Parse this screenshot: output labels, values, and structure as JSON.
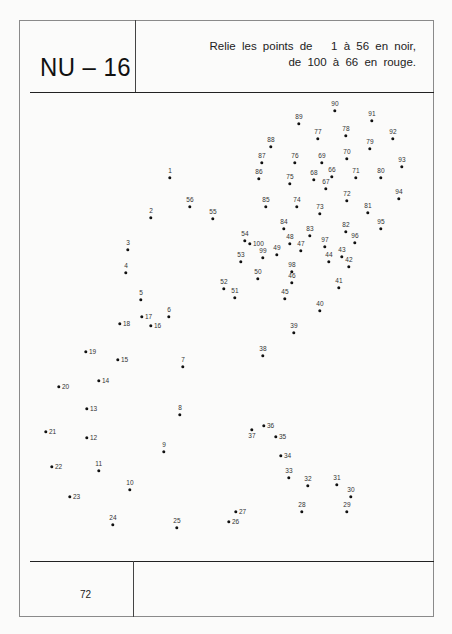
{
  "header": {
    "code": "NU – 16",
    "instruction_line1": "Relie les points de   1 à 56 en noir,",
    "instruction_line2": "de 100 à 66 en rouge."
  },
  "footer": {
    "page_number": "72"
  },
  "colors": {
    "ink": "#111111",
    "frame": "#8a8a8a",
    "paper": "#fbfbfa"
  },
  "puzzle": {
    "black_sequence": "1-56",
    "red_sequence": "100-66",
    "dots": [
      {
        "n": "1",
        "x": 170,
        "y": 178,
        "pos": "above"
      },
      {
        "n": "2",
        "x": 151,
        "y": 218,
        "pos": "above"
      },
      {
        "n": "3",
        "x": 128,
        "y": 250,
        "pos": "above"
      },
      {
        "n": "4",
        "x": 126,
        "y": 273,
        "pos": "above"
      },
      {
        "n": "5",
        "x": 141,
        "y": 300,
        "pos": "above"
      },
      {
        "n": "6",
        "x": 169,
        "y": 317,
        "pos": "above"
      },
      {
        "n": "7",
        "x": 183,
        "y": 367,
        "pos": "above"
      },
      {
        "n": "8",
        "x": 180,
        "y": 415,
        "pos": "above"
      },
      {
        "n": "9",
        "x": 164,
        "y": 452,
        "pos": "above"
      },
      {
        "n": "10",
        "x": 130,
        "y": 490,
        "pos": "above"
      },
      {
        "n": "11",
        "x": 99,
        "y": 471,
        "pos": "above"
      },
      {
        "n": "12",
        "x": 87,
        "y": 438,
        "pos": "right"
      },
      {
        "n": "13",
        "x": 87,
        "y": 409,
        "pos": "right"
      },
      {
        "n": "14",
        "x": 99,
        "y": 381,
        "pos": "right"
      },
      {
        "n": "15",
        "x": 118,
        "y": 360,
        "pos": "right"
      },
      {
        "n": "16",
        "x": 151,
        "y": 326,
        "pos": "right"
      },
      {
        "n": "17",
        "x": 142,
        "y": 317,
        "pos": "right"
      },
      {
        "n": "18",
        "x": 120,
        "y": 324,
        "pos": "right"
      },
      {
        "n": "19",
        "x": 86,
        "y": 352,
        "pos": "right"
      },
      {
        "n": "20",
        "x": 59,
        "y": 387,
        "pos": "right"
      },
      {
        "n": "21",
        "x": 46,
        "y": 432,
        "pos": "right"
      },
      {
        "n": "22",
        "x": 52,
        "y": 467,
        "pos": "right"
      },
      {
        "n": "23",
        "x": 70,
        "y": 497,
        "pos": "right"
      },
      {
        "n": "24",
        "x": 113,
        "y": 525,
        "pos": "above"
      },
      {
        "n": "25",
        "x": 177,
        "y": 528,
        "pos": "above"
      },
      {
        "n": "26",
        "x": 229,
        "y": 522,
        "pos": "right"
      },
      {
        "n": "27",
        "x": 236,
        "y": 512,
        "pos": "right"
      },
      {
        "n": "28",
        "x": 302,
        "y": 512,
        "pos": "above"
      },
      {
        "n": "29",
        "x": 347,
        "y": 512,
        "pos": "above"
      },
      {
        "n": "30",
        "x": 351,
        "y": 497,
        "pos": "above"
      },
      {
        "n": "31",
        "x": 337,
        "y": 485,
        "pos": "above"
      },
      {
        "n": "32",
        "x": 308,
        "y": 486,
        "pos": "above"
      },
      {
        "n": "33",
        "x": 289,
        "y": 478,
        "pos": "above"
      },
      {
        "n": "34",
        "x": 281,
        "y": 456,
        "pos": "right"
      },
      {
        "n": "35",
        "x": 276,
        "y": 437,
        "pos": "right"
      },
      {
        "n": "36",
        "x": 264,
        "y": 426,
        "pos": "right"
      },
      {
        "n": "37",
        "x": 252,
        "y": 430,
        "pos": "below"
      },
      {
        "n": "38",
        "x": 263,
        "y": 356,
        "pos": "above"
      },
      {
        "n": "39",
        "x": 294,
        "y": 333,
        "pos": "above"
      },
      {
        "n": "40",
        "x": 320,
        "y": 311,
        "pos": "above"
      },
      {
        "n": "41",
        "x": 339,
        "y": 288,
        "pos": "above"
      },
      {
        "n": "42",
        "x": 349,
        "y": 267,
        "pos": "above"
      },
      {
        "n": "43",
        "x": 342,
        "y": 257,
        "pos": "above"
      },
      {
        "n": "44",
        "x": 329,
        "y": 262,
        "pos": "above"
      },
      {
        "n": "45",
        "x": 285,
        "y": 299,
        "pos": "above"
      },
      {
        "n": "46",
        "x": 292,
        "y": 283,
        "pos": "above"
      },
      {
        "n": "47",
        "x": 301,
        "y": 251,
        "pos": "above"
      },
      {
        "n": "48",
        "x": 290,
        "y": 244,
        "pos": "above"
      },
      {
        "n": "49",
        "x": 277,
        "y": 255,
        "pos": "above"
      },
      {
        "n": "50",
        "x": 258,
        "y": 279,
        "pos": "above"
      },
      {
        "n": "51",
        "x": 235,
        "y": 298,
        "pos": "above"
      },
      {
        "n": "52",
        "x": 224,
        "y": 289,
        "pos": "above"
      },
      {
        "n": "53",
        "x": 241,
        "y": 262,
        "pos": "above"
      },
      {
        "n": "54",
        "x": 245,
        "y": 241,
        "pos": "above"
      },
      {
        "n": "55",
        "x": 213,
        "y": 219,
        "pos": "above"
      },
      {
        "n": "56",
        "x": 190,
        "y": 207,
        "pos": "above"
      },
      {
        "n": "66",
        "x": 332,
        "y": 177,
        "pos": "above"
      },
      {
        "n": "67",
        "x": 326,
        "y": 189,
        "pos": "above"
      },
      {
        "n": "68",
        "x": 314,
        "y": 180,
        "pos": "above"
      },
      {
        "n": "69",
        "x": 322,
        "y": 163,
        "pos": "above"
      },
      {
        "n": "70",
        "x": 347,
        "y": 159,
        "pos": "above"
      },
      {
        "n": "71",
        "x": 356,
        "y": 178,
        "pos": "above"
      },
      {
        "n": "72",
        "x": 347,
        "y": 201,
        "pos": "above"
      },
      {
        "n": "73",
        "x": 320,
        "y": 214,
        "pos": "above"
      },
      {
        "n": "74",
        "x": 297,
        "y": 207,
        "pos": "above"
      },
      {
        "n": "75",
        "x": 290,
        "y": 184,
        "pos": "above"
      },
      {
        "n": "76",
        "x": 295,
        "y": 163,
        "pos": "above"
      },
      {
        "n": "77",
        "x": 318,
        "y": 139,
        "pos": "above"
      },
      {
        "n": "78",
        "x": 346,
        "y": 136,
        "pos": "above"
      },
      {
        "n": "79",
        "x": 370,
        "y": 149,
        "pos": "above"
      },
      {
        "n": "80",
        "x": 381,
        "y": 178,
        "pos": "above"
      },
      {
        "n": "81",
        "x": 368,
        "y": 213,
        "pos": "above"
      },
      {
        "n": "82",
        "x": 346,
        "y": 232,
        "pos": "above"
      },
      {
        "n": "83",
        "x": 310,
        "y": 236,
        "pos": "above"
      },
      {
        "n": "84",
        "x": 284,
        "y": 229,
        "pos": "above"
      },
      {
        "n": "85",
        "x": 266,
        "y": 207,
        "pos": "above"
      },
      {
        "n": "86",
        "x": 259,
        "y": 179,
        "pos": "above"
      },
      {
        "n": "87",
        "x": 262,
        "y": 163,
        "pos": "above"
      },
      {
        "n": "88",
        "x": 271,
        "y": 147,
        "pos": "above"
      },
      {
        "n": "89",
        "x": 299,
        "y": 124,
        "pos": "above"
      },
      {
        "n": "90",
        "x": 335,
        "y": 111,
        "pos": "above"
      },
      {
        "n": "91",
        "x": 372,
        "y": 121,
        "pos": "above"
      },
      {
        "n": "92",
        "x": 393,
        "y": 139,
        "pos": "above"
      },
      {
        "n": "93",
        "x": 402,
        "y": 167,
        "pos": "above"
      },
      {
        "n": "94",
        "x": 399,
        "y": 199,
        "pos": "above"
      },
      {
        "n": "95",
        "x": 381,
        "y": 229,
        "pos": "above"
      },
      {
        "n": "96",
        "x": 355,
        "y": 243,
        "pos": "above"
      },
      {
        "n": "97",
        "x": 325,
        "y": 247,
        "pos": "above"
      },
      {
        "n": "98",
        "x": 292,
        "y": 272,
        "pos": "above"
      },
      {
        "n": "99",
        "x": 263,
        "y": 258,
        "pos": "above"
      },
      {
        "n": "100",
        "x": 250,
        "y": 244,
        "pos": "right"
      }
    ]
  }
}
